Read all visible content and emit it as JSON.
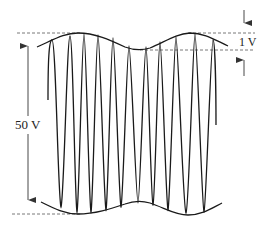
{
  "figure": {
    "type": "amplitude-modulated-waveform",
    "colors": {
      "stroke": "#1a1a1a",
      "dashed": "#555555",
      "arrow": "#333333",
      "background": "#ffffff"
    },
    "labels": {
      "peak_to_peak": "50 V",
      "ripple": "1 V"
    },
    "annotations": {
      "peak_to_peak_arrow": {
        "x": 28,
        "y_top": 36,
        "y_bottom": 210
      },
      "ripple_arrows": {
        "x": 244,
        "upper_dash_y": 33,
        "lower_dash_y": 50
      }
    },
    "dashed_lines": [
      {
        "name": "top-reference",
        "x1": 17,
        "x2": 255,
        "y": 33
      },
      {
        "name": "ripple-reference",
        "x1": 140,
        "x2": 255,
        "y": 50
      },
      {
        "name": "bottom-reference",
        "x1": 12,
        "x2": 80,
        "y": 214
      }
    ],
    "carrier": {
      "top_peaks_x": [
        52,
        70,
        84,
        98,
        113,
        129,
        146,
        160,
        176,
        195,
        213
      ],
      "bottom_troughs_x": [
        61,
        77,
        91,
        106,
        121,
        138,
        153,
        168,
        186,
        204
      ]
    }
  }
}
